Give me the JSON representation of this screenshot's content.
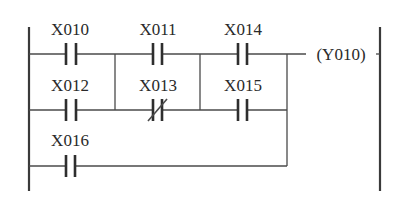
{
  "diagram": {
    "type": "ladder-logic",
    "colors": {
      "ink": "#2a2a2a",
      "background": "#ffffff"
    },
    "contacts": [
      {
        "id": "X010",
        "label": "X010",
        "kind": "normally-open",
        "row": 1,
        "col": 1
      },
      {
        "id": "X011",
        "label": "X011",
        "kind": "normally-open",
        "row": 1,
        "col": 2
      },
      {
        "id": "X014",
        "label": "X014",
        "kind": "normally-open",
        "row": 1,
        "col": 3
      },
      {
        "id": "X012",
        "label": "X012",
        "kind": "normally-open",
        "row": 2,
        "col": 1
      },
      {
        "id": "X013",
        "label": "X013",
        "kind": "normally-closed",
        "row": 2,
        "col": 2
      },
      {
        "id": "X015",
        "label": "X015",
        "kind": "normally-open",
        "row": 2,
        "col": 3
      },
      {
        "id": "X016",
        "label": "X016",
        "kind": "normally-open",
        "row": 3,
        "col": 1
      }
    ],
    "coil": {
      "id": "Y010",
      "label": "(Y010)"
    }
  }
}
